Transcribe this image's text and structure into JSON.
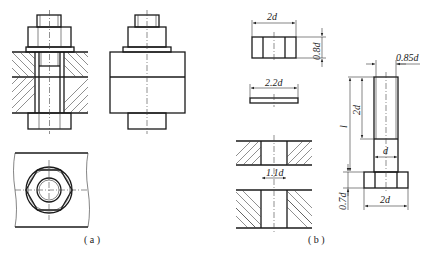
{
  "figure": {
    "panels": [
      {
        "id": "a",
        "label": "( a )",
        "description": "Bolted joint: section view, exterior view, top view"
      },
      {
        "id": "b",
        "label": "( b )",
        "description": "Proportional dimensions of nut, washer, plate holes and bolt"
      }
    ],
    "dimensions": {
      "nut_width": "2d",
      "nut_height": "0.8d",
      "washer_width": "2.2d",
      "hole_diameter": "1.1d",
      "bolt_length": "l",
      "thread_length": "2d",
      "thread_minor": "0.85d",
      "bolt_diameter": "d",
      "head_height": "0.7d",
      "head_width": "2d"
    },
    "colors": {
      "line": "#222222",
      "background": "#ffffff"
    }
  }
}
